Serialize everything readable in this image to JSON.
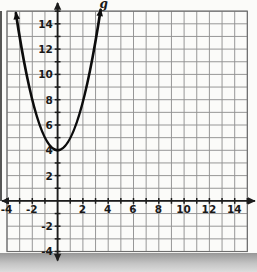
{
  "figure": {
    "curve_label": "g"
  },
  "chart_data": {
    "type": "line",
    "title": "",
    "xlabel": "",
    "ylabel": "",
    "x_axis": {
      "min": -4,
      "max": 15,
      "gridline_step": 1,
      "tick_step": 1,
      "labeled_values": [
        -4,
        -2,
        2,
        4,
        6,
        8,
        10,
        12,
        14
      ]
    },
    "y_axis": {
      "min": -4,
      "max": 15,
      "gridline_step": 1,
      "tick_step": 1,
      "labeled_values": [
        14,
        12,
        10,
        8,
        6,
        4,
        2,
        -2,
        -4
      ]
    },
    "grid": true,
    "legend": "none",
    "series": [
      {
        "name": "g",
        "equation": "y = x^2 + 4",
        "vertex": [
          0,
          4
        ],
        "points": [
          [
            -3,
            13
          ],
          [
            -2,
            8
          ],
          [
            -1,
            5
          ],
          [
            0,
            4
          ],
          [
            1,
            5
          ],
          [
            2,
            8
          ],
          [
            3,
            13
          ]
        ],
        "drawn_extent": {
          "left_end": [
            -3.3,
            14.85
          ],
          "right_end": [
            3.4,
            15.1
          ]
        },
        "arrows_both_ends": true
      }
    ]
  },
  "style": {
    "paper": "#fbfbf9",
    "grid_color": "#919191",
    "grid_border_color": "#6e6e6e",
    "axis_color": "#1c1c1c",
    "label_color": "#191919",
    "curve_color": "#0c0c0c",
    "shadow_top": "#979797",
    "shadow_mid": "#c4c4c4",
    "shadow_bottom": "#dcdcdc",
    "edge_artifact": "#383838"
  }
}
